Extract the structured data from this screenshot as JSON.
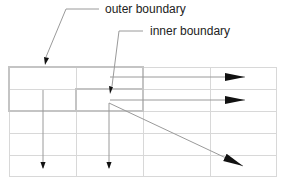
{
  "diagram": {
    "title": "",
    "labels": {
      "outer": "outer boundary",
      "inner": "inner boundary"
    },
    "grid": {
      "columns_x": [
        9,
        76,
        143,
        210,
        276
      ],
      "rows_y": [
        67,
        89,
        111,
        133,
        155,
        176
      ],
      "line_color": "#d8d8d8"
    },
    "outer_boundary": {
      "x": 9,
      "y": 67,
      "width": 134,
      "height": 44,
      "color": "#c8c8c8"
    },
    "inner_boundary": {
      "x": 76,
      "y": 89,
      "width": 67,
      "height": 22,
      "color": "#c8c8c8"
    },
    "arrows": [
      {
        "from": [
          110,
          76
        ],
        "to": [
          245,
          76
        ],
        "direction": "right"
      },
      {
        "from": [
          110,
          100
        ],
        "to": [
          245,
          100
        ],
        "direction": "right"
      },
      {
        "from": [
          43,
          89
        ],
        "to": [
          43,
          168
        ],
        "direction": "down"
      },
      {
        "from": [
          109,
          103
        ],
        "to": [
          109,
          168
        ],
        "direction": "down"
      },
      {
        "from": [
          109,
          103
        ],
        "to": [
          243,
          166
        ],
        "direction": "down-right"
      }
    ],
    "arrow_color": "#111111",
    "leader_color": "#888888"
  }
}
